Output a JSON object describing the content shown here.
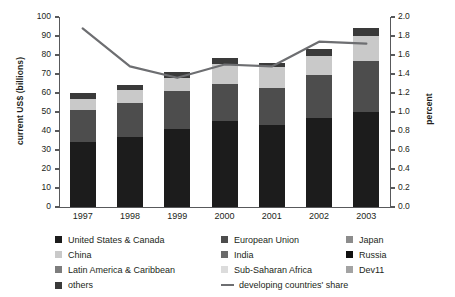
{
  "chart_data": {
    "type": "bar",
    "title": "",
    "subtitle": "",
    "xlabel": "",
    "ylabel": "current US$ (billions)",
    "y2label": "percent",
    "categories": [
      "1997",
      "1998",
      "1999",
      "2000",
      "2001",
      "2002",
      "2003"
    ],
    "ylim": [
      0,
      100
    ],
    "y2lim": [
      0,
      2.0
    ],
    "yticks": [
      "0",
      "10",
      "20",
      "30",
      "40",
      "50",
      "60",
      "70",
      "80",
      "90",
      "100"
    ],
    "ytick_values": [
      0,
      10,
      20,
      30,
      40,
      50,
      60,
      70,
      80,
      90,
      100
    ],
    "y2ticks": [
      "0.0",
      "0.2",
      "0.4",
      "0.6",
      "0.8",
      "1.0",
      "1.2",
      "1.4",
      "1.6",
      "1.8",
      "2.0"
    ],
    "y2tick_values": [
      0.0,
      0.2,
      0.4,
      0.6,
      0.8,
      1.0,
      1.2,
      1.4,
      1.6,
      1.8,
      2.0
    ],
    "grid": false,
    "legend_position": "bottom",
    "stacked": true,
    "series": [
      {
        "name": "United States & Canada",
        "color": "#1c1c1c",
        "values": [
          34.0,
          37.0,
          41.0,
          45.5,
          43.0,
          47.0,
          50.0
        ]
      },
      {
        "name": "European Union",
        "color": "#4d4d4d",
        "values": [
          17.0,
          18.0,
          20.0,
          19.5,
          19.5,
          22.5,
          27.0
        ]
      },
      {
        "name": "Japan",
        "color": "#8c8c8c",
        "values": [
          0.0,
          0.0,
          0.0,
          0.0,
          0.0,
          0.0,
          0.0
        ]
      },
      {
        "name": "China",
        "color": "#c9c9c9",
        "values": [
          6.0,
          6.5,
          7.0,
          10.5,
          11.0,
          10.0,
          13.0
        ]
      },
      {
        "name": "India",
        "color": "#6b6b6b",
        "values": [
          0.0,
          0.0,
          0.0,
          0.0,
          0.0,
          0.0,
          0.0
        ]
      },
      {
        "name": "Russia",
        "color": "#111111",
        "values": [
          0.0,
          0.0,
          0.0,
          0.0,
          0.0,
          0.0,
          0.0
        ]
      },
      {
        "name": "Latin America & Caribbean",
        "color": "#7d7d7d",
        "values": [
          0.0,
          0.0,
          0.0,
          0.0,
          0.0,
          0.0,
          0.0
        ]
      },
      {
        "name": "Sub-Saharan Africa",
        "color": "#dcdcdc",
        "values": [
          0.0,
          0.0,
          0.0,
          0.0,
          0.0,
          0.0,
          0.0
        ]
      },
      {
        "name": "Dev11",
        "color": "#a3a3a3",
        "values": [
          0.0,
          0.0,
          0.0,
          0.0,
          0.0,
          0.0,
          0.0
        ]
      },
      {
        "name": "others",
        "color": "#3a3a3a",
        "values": [
          3.2,
          2.5,
          3.0,
          3.0,
          2.5,
          3.5,
          4.0
        ]
      }
    ],
    "bar_totals": [
      60.2,
      64.0,
      71.0,
      78.5,
      76.0,
      83.0,
      94.0
    ],
    "line_series": {
      "name": "developing countries' share",
      "color": "#6d6e71",
      "axis": "right",
      "values": [
        1.88,
        1.48,
        1.36,
        1.5,
        1.48,
        1.74,
        1.72
      ]
    }
  },
  "legend": {
    "rows": [
      [
        {
          "label": "United States & Canada",
          "swatch": "#1c1c1c",
          "kind": "swatch"
        },
        {
          "label": "European Union",
          "swatch": "#4d4d4d",
          "kind": "swatch"
        },
        {
          "label": "Japan",
          "swatch": "#8c8c8c",
          "kind": "swatch"
        }
      ],
      [
        {
          "label": "China",
          "swatch": "#c9c9c9",
          "kind": "swatch"
        },
        {
          "label": "India",
          "swatch": "#6b6b6b",
          "kind": "swatch"
        },
        {
          "label": "Russia",
          "swatch": "#111111",
          "kind": "swatch"
        }
      ],
      [
        {
          "label": "Latin America & Caribbean",
          "swatch": "#7d7d7d",
          "kind": "swatch"
        },
        {
          "label": "Sub-Saharan Africa",
          "swatch": "#dcdcdc",
          "kind": "swatch"
        },
        {
          "label": "Dev11",
          "swatch": "#a3a3a3",
          "kind": "swatch"
        }
      ],
      [
        {
          "label": "others",
          "swatch": "#3a3a3a",
          "kind": "swatch"
        },
        {
          "label": "developing countries' share",
          "swatch": "#6d6e71",
          "kind": "line"
        }
      ]
    ]
  },
  "colors": {
    "axis": "#58595b",
    "text": "#231f20",
    "line": "#6d6e71",
    "background": "#ffffff"
  }
}
